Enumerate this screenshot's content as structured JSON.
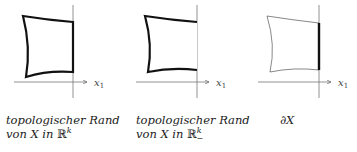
{
  "panels": [
    {
      "axis_label": "x",
      "axis_subscript": "1",
      "caption_line1": "topologischer Rand",
      "caption_line2_prefix": "von X in ",
      "caption_space": "ℝ",
      "caption_sup": "k",
      "boundary_style": "whole boundary thick"
    },
    {
      "axis_label": "x",
      "axis_subscript": "1",
      "caption_line1": "topologischer Rand",
      "caption_line2_prefix": "von X in ",
      "caption_space": "ℝ",
      "caption_sup": "k",
      "caption_sub": "−",
      "boundary_style": "thick except edge on x1-axis"
    },
    {
      "axis_label": "x",
      "axis_subscript": "1",
      "caption_line1": "∂X",
      "boundary_style": "thin boundary, thick edge on x1-axis"
    }
  ]
}
